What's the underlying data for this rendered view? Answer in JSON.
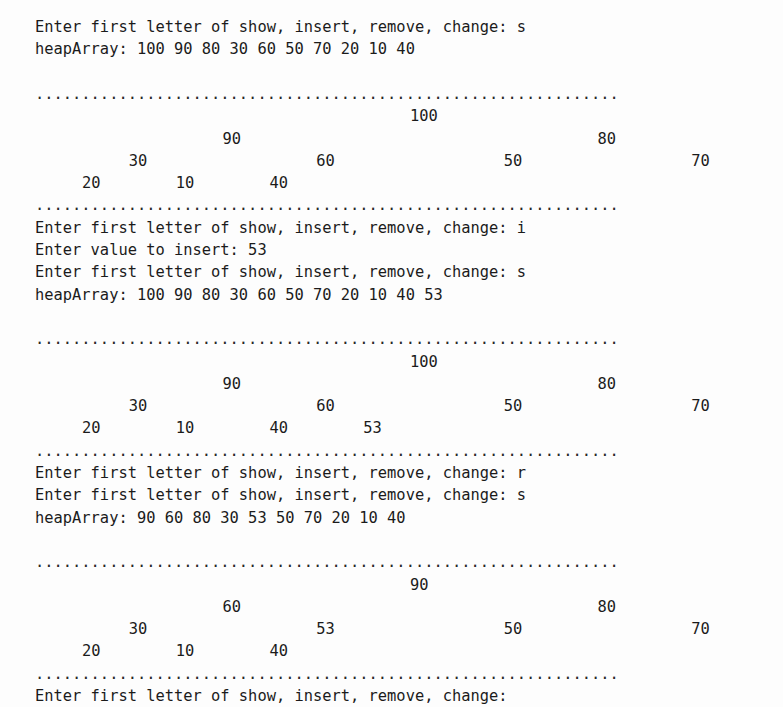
{
  "terminal": {
    "char_width_px": 11.72,
    "line_height_px": 22.3,
    "left_margin_px": 35,
    "top_margin_px": 16,
    "background_color": "#fdfdfd",
    "text_color": "#1b1b1b",
    "dot_count": 63,
    "separator_char": "."
  },
  "prompts": {
    "menu_prompt": "Enter first letter of show, insert, remove, change: ",
    "insert_prompt": "Enter value to insert: ",
    "menu_prompt_blank": "Enter first letter of show, insert, remove, change:",
    "array_label": "heapArray: "
  },
  "lines": [
    {
      "id": "l0",
      "row": 0,
      "type": "text",
      "text": "Enter first letter of show, insert, remove, change: s"
    },
    {
      "id": "l1",
      "row": 1,
      "type": "text",
      "text": "heapArray: 100 90 80 30 60 50 70 20 10 40"
    },
    {
      "id": "l2",
      "row": 2,
      "type": "blank",
      "text": ""
    },
    {
      "id": "l3",
      "row": 3,
      "type": "separator",
      "text": "..............................................................."
    },
    {
      "id": "l4",
      "row": 4,
      "type": "tree",
      "tree_index": 0,
      "level": 0
    },
    {
      "id": "l5",
      "row": 5,
      "type": "tree",
      "tree_index": 0,
      "level": 1
    },
    {
      "id": "l6",
      "row": 6,
      "type": "tree",
      "tree_index": 0,
      "level": 2
    },
    {
      "id": "l7",
      "row": 7,
      "type": "tree",
      "tree_index": 0,
      "level": 3
    },
    {
      "id": "l8",
      "row": 8,
      "type": "separator",
      "text": "..............................................................."
    },
    {
      "id": "l9",
      "row": 9,
      "type": "text",
      "text": "Enter first letter of show, insert, remove, change: i"
    },
    {
      "id": "l10",
      "row": 10,
      "type": "text",
      "text": "Enter value to insert: 53"
    },
    {
      "id": "l11",
      "row": 11,
      "type": "text",
      "text": "Enter first letter of show, insert, remove, change: s"
    },
    {
      "id": "l12",
      "row": 12,
      "type": "text",
      "text": "heapArray: 100 90 80 30 60 50 70 20 10 40 53"
    },
    {
      "id": "l13",
      "row": 13,
      "type": "blank",
      "text": ""
    },
    {
      "id": "l14",
      "row": 14,
      "type": "separator",
      "text": "..............................................................."
    },
    {
      "id": "l15",
      "row": 15,
      "type": "tree",
      "tree_index": 1,
      "level": 0
    },
    {
      "id": "l16",
      "row": 16,
      "type": "tree",
      "tree_index": 1,
      "level": 1
    },
    {
      "id": "l17",
      "row": 17,
      "type": "tree",
      "tree_index": 1,
      "level": 2
    },
    {
      "id": "l18",
      "row": 18,
      "type": "tree",
      "tree_index": 1,
      "level": 3
    },
    {
      "id": "l19",
      "row": 19,
      "type": "separator",
      "text": "..............................................................."
    },
    {
      "id": "l20",
      "row": 20,
      "type": "text",
      "text": "Enter first letter of show, insert, remove, change: r"
    },
    {
      "id": "l21",
      "row": 21,
      "type": "text",
      "text": "Enter first letter of show, insert, remove, change: s"
    },
    {
      "id": "l22",
      "row": 22,
      "type": "text",
      "text": "heapArray: 90 60 80 30 53 50 70 20 10 40"
    },
    {
      "id": "l23",
      "row": 23,
      "type": "blank",
      "text": ""
    },
    {
      "id": "l24",
      "row": 24,
      "type": "separator",
      "text": "..............................................................."
    },
    {
      "id": "l25",
      "row": 25,
      "type": "tree",
      "tree_index": 2,
      "level": 0
    },
    {
      "id": "l26",
      "row": 26,
      "type": "tree",
      "tree_index": 2,
      "level": 1
    },
    {
      "id": "l27",
      "row": 27,
      "type": "tree",
      "tree_index": 2,
      "level": 2
    },
    {
      "id": "l28",
      "row": 28,
      "type": "tree",
      "tree_index": 2,
      "level": 3
    },
    {
      "id": "l29",
      "row": 29,
      "type": "separator",
      "text": "..............................................................."
    },
    {
      "id": "l30",
      "row": 30,
      "type": "text",
      "text": "Enter first letter of show, insert, remove, change:"
    }
  ],
  "heap_arrays": [
    {
      "label": "heapArray: ",
      "values": [
        100,
        90,
        80,
        30,
        60,
        50,
        70,
        20,
        10,
        40
      ]
    },
    {
      "label": "heapArray: ",
      "values": [
        100,
        90,
        80,
        30,
        60,
        50,
        70,
        20,
        10,
        40,
        53
      ]
    },
    {
      "label": "heapArray: ",
      "values": [
        90,
        60,
        80,
        30,
        53,
        50,
        70,
        20,
        10,
        40
      ]
    }
  ],
  "trees": [
    {
      "name": "tree-after-show-1",
      "levels": [
        [
          {
            "value": "100",
            "col": 32
          }
        ],
        [
          {
            "value": "90",
            "col": 16
          },
          {
            "value": "80",
            "col": 48
          }
        ],
        [
          {
            "value": "30",
            "col": 8
          },
          {
            "value": "60",
            "col": 24
          },
          {
            "value": "50",
            "col": 40
          },
          {
            "value": "70",
            "col": 56
          }
        ],
        [
          {
            "value": "20",
            "col": 4
          },
          {
            "value": "10",
            "col": 12
          },
          {
            "value": "40",
            "col": 20
          }
        ]
      ]
    },
    {
      "name": "tree-after-insert-53",
      "levels": [
        [
          {
            "value": "100",
            "col": 32
          }
        ],
        [
          {
            "value": "90",
            "col": 16
          },
          {
            "value": "80",
            "col": 48
          }
        ],
        [
          {
            "value": "30",
            "col": 8
          },
          {
            "value": "60",
            "col": 24
          },
          {
            "value": "50",
            "col": 40
          },
          {
            "value": "70",
            "col": 56
          }
        ],
        [
          {
            "value": "20",
            "col": 4
          },
          {
            "value": "10",
            "col": 12
          },
          {
            "value": "40",
            "col": 20
          },
          {
            "value": "53",
            "col": 28
          }
        ]
      ]
    },
    {
      "name": "tree-after-remove",
      "levels": [
        [
          {
            "value": "90",
            "col": 32
          }
        ],
        [
          {
            "value": "60",
            "col": 16
          },
          {
            "value": "80",
            "col": 48
          }
        ],
        [
          {
            "value": "30",
            "col": 8
          },
          {
            "value": "53",
            "col": 24
          },
          {
            "value": "50",
            "col": 40
          },
          {
            "value": "70",
            "col": 56
          }
        ],
        [
          {
            "value": "20",
            "col": 4
          },
          {
            "value": "10",
            "col": 12
          },
          {
            "value": "40",
            "col": 20
          }
        ]
      ]
    }
  ],
  "user_inputs": [
    {
      "step": 1,
      "command": "s",
      "meaning": "show"
    },
    {
      "step": 2,
      "command": "i",
      "meaning": "insert"
    },
    {
      "step": 3,
      "value": "53",
      "meaning": "value to insert"
    },
    {
      "step": 4,
      "command": "s",
      "meaning": "show"
    },
    {
      "step": 5,
      "command": "r",
      "meaning": "remove"
    },
    {
      "step": 6,
      "command": "s",
      "meaning": "show"
    }
  ],
  "cursor": {
    "row": 30,
    "col": 51
  }
}
